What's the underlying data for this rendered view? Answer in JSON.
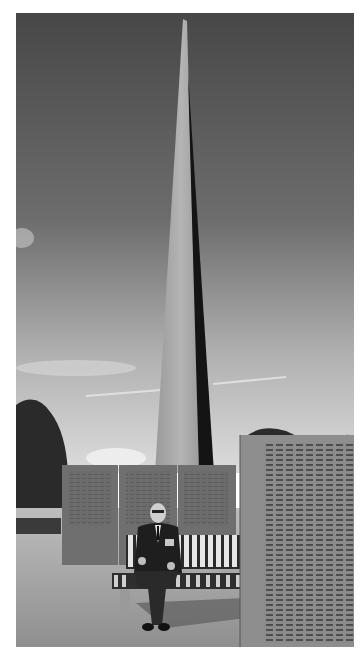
{
  "image": {
    "description": "Black-and-white photograph of an elderly veteran in a suit with medals sitting on a slatted bench in front of a tall concrete obelisk memorial and walls engraved with names",
    "colors": {
      "border": "#ffffff",
      "sky_top": "#4a4a4a",
      "sky_bottom": "#d8d8d8",
      "obelisk_light": "#a8a8a8",
      "obelisk_shadow": "#151515",
      "wall": "#6e6e6e",
      "ground": "#a9a9a9"
    }
  }
}
